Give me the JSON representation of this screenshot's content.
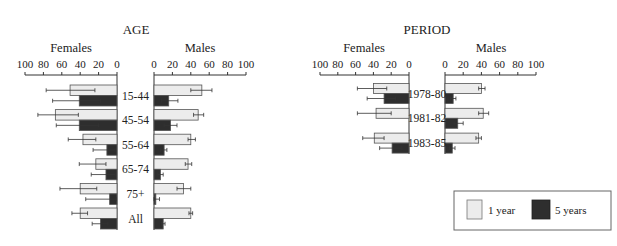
{
  "colors": {
    "one_year_fill": "#ececec",
    "five_year_fill": "#2e2e2e",
    "bar_stroke": "#555555",
    "axis": "#333333"
  },
  "legend": {
    "items": [
      {
        "label": "1 year",
        "color": "#ececec"
      },
      {
        "label": "5 years",
        "color": "#2e2e2e"
      }
    ]
  },
  "chart_data": [
    {
      "type": "bar",
      "orientation": "horizontal-back-to-back",
      "title": "AGE",
      "left_label": "Females",
      "right_label": "Males",
      "xticks": [
        0,
        20,
        40,
        60,
        80,
        100
      ],
      "xlim": [
        0,
        100
      ],
      "categories": [
        "15-44",
        "45-54",
        "55-64",
        "65-74",
        "75+",
        "All"
      ],
      "series": [
        {
          "name": "1 year",
          "sex": "Females",
          "values": [
            51,
            67,
            37,
            23,
            40,
            40
          ],
          "err_low": [
            24,
            42,
            23,
            12,
            22,
            32
          ],
          "err_high": [
            77,
            86,
            53,
            41,
            62,
            49
          ]
        },
        {
          "name": "5 years",
          "sex": "Females",
          "values": [
            41,
            41,
            11,
            12,
            8,
            18
          ],
          "err_low": [
            18,
            20,
            2,
            2,
            1,
            10
          ],
          "err_high": [
            70,
            66,
            26,
            28,
            34,
            27
          ]
        },
        {
          "name": "1 year",
          "sex": "Males",
          "values": [
            52,
            48,
            40,
            37,
            32,
            40
          ],
          "err_low": [
            40,
            43,
            37,
            34,
            25,
            38
          ],
          "err_high": [
            63,
            54,
            45,
            41,
            40,
            42
          ]
        },
        {
          "name": "5 years",
          "sex": "Males",
          "values": [
            16,
            18,
            11,
            7,
            2,
            10
          ],
          "err_low": [
            8,
            11,
            7,
            4,
            0,
            8
          ],
          "err_high": [
            26,
            25,
            14,
            10,
            6,
            12
          ]
        }
      ]
    },
    {
      "type": "bar",
      "orientation": "horizontal-back-to-back",
      "title": "PERIOD",
      "left_label": "Females",
      "right_label": "Males",
      "xticks": [
        0,
        20,
        40,
        60,
        80,
        100
      ],
      "xlim": [
        0,
        100
      ],
      "categories": [
        "1978-80",
        "1981-82",
        "1983-85"
      ],
      "series": [
        {
          "name": "1 year",
          "sex": "Females",
          "values": [
            40,
            37,
            39
          ],
          "err_low": [
            25,
            20,
            28
          ],
          "err_high": [
            58,
            58,
            52
          ]
        },
        {
          "name": "5 years",
          "sex": "Females",
          "values": [
            28,
            0,
            19
          ],
          "err_low": [
            15,
            0,
            8
          ],
          "err_high": [
            47,
            0,
            33
          ]
        },
        {
          "name": "1 year",
          "sex": "Males",
          "values": [
            40,
            42,
            37
          ],
          "err_low": [
            37,
            37,
            34
          ],
          "err_high": [
            44,
            48,
            40
          ]
        },
        {
          "name": "5 years",
          "sex": "Males",
          "values": [
            9,
            14,
            8
          ],
          "err_low": [
            6,
            10,
            5
          ],
          "err_high": [
            12,
            20,
            11
          ]
        }
      ]
    }
  ]
}
